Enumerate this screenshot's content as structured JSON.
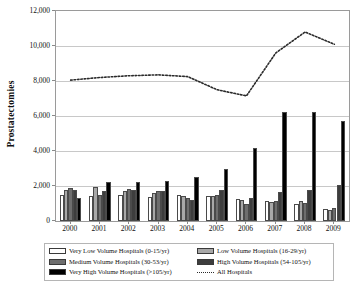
{
  "chart_data": {
    "type": "bar",
    "title": "",
    "xlabel": "",
    "ylabel": "Prostatectomies",
    "ylim": [
      0,
      12000
    ],
    "ytick_labels": [
      "0",
      "2,000",
      "4,000",
      "6,000",
      "8,000",
      "10,000",
      "12,000"
    ],
    "ytick_values": [
      0,
      2000,
      4000,
      6000,
      8000,
      10000,
      12000
    ],
    "grid": true,
    "legend_position": "bottom",
    "categories": [
      "2000",
      "2001",
      "2002",
      "2003",
      "2004",
      "2005",
      "2006",
      "2007",
      "2008",
      "2009"
    ],
    "series": [
      {
        "name": "Very Low Volume Hospitals (0-15/yr)",
        "type": "bar",
        "color": "#ffffff",
        "values": [
          1500,
          1450,
          1500,
          1400,
          1500,
          1450,
          1250,
          1150,
          1000,
          700
        ]
      },
      {
        "name": "Low Volume Hospitals (16-29/yr)",
        "type": "bar",
        "color": "#a8a8a8",
        "values": [
          1800,
          1950,
          1700,
          1600,
          1450,
          1450,
          1200,
          1100,
          1150,
          650
        ]
      },
      {
        "name": "Medium Volume Hospitals (30-53/yr)",
        "type": "bar",
        "color": "#6e6e6e",
        "values": [
          1900,
          1500,
          1850,
          1700,
          1300,
          1500,
          1000,
          1150,
          1050,
          750
        ]
      },
      {
        "name": "High Volume Hospitals (54-105/yr)",
        "type": "bar",
        "color": "#3d3d3d",
        "values": [
          1800,
          1700,
          1800,
          1700,
          1200,
          1800,
          1300,
          1650,
          1750,
          2050
        ]
      },
      {
        "name": "Very High Volume Hospitals (>105/yr)",
        "type": "bar",
        "color": "#000000",
        "values": [
          1300,
          2250,
          2250,
          2300,
          2500,
          2950,
          4200,
          6250,
          6250,
          5700
        ]
      },
      {
        "name": "All Hospitals",
        "type": "line",
        "style": "dotted",
        "color": "#2b2b2b",
        "values": [
          8050,
          8200,
          8300,
          8350,
          8250,
          7600,
          7150,
          7950,
          9100,
          10350
        ]
      }
    ],
    "line_extra": {
      "note": "All Hospitals dotted line peaks 2007 at ~10,800 then declines to ~10,100 by 2009",
      "values_plotted": [
        8050,
        8200,
        8300,
        8350,
        8250,
        7600,
        7150,
        7950,
        9100,
        10800,
        10400,
        10100
      ]
    }
  },
  "legend": {
    "entries": [
      {
        "label": "Very Low Volume Hospitals (0-15/yr)",
        "swatch": "#ffffff",
        "kind": "bar"
      },
      {
        "label": "Low Volume Hospitals (16-29/yr)",
        "swatch": "#a8a8a8",
        "kind": "bar"
      },
      {
        "label": "Medium Volume Hospitals (30-53/yr)",
        "swatch": "#6e6e6e",
        "kind": "bar"
      },
      {
        "label": "High Volume Hospitals (54-105/yr)",
        "swatch": "#3d3d3d",
        "kind": "bar"
      },
      {
        "label": "Very High Volume Hospitals (>105/yr)",
        "swatch": "#000000",
        "kind": "bar"
      },
      {
        "label": "All Hospitals",
        "swatch": "#2b2b2b",
        "kind": "dotted-line"
      }
    ]
  }
}
